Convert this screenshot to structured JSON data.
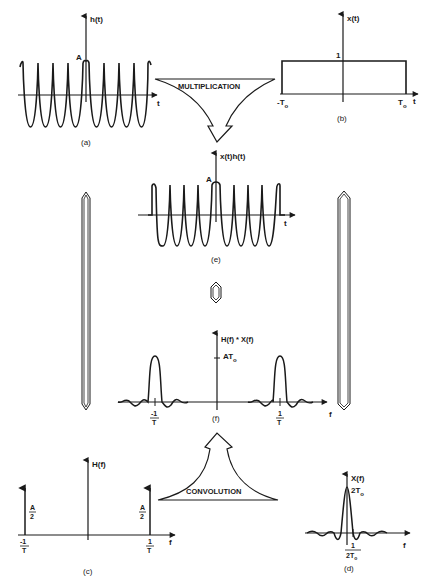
{
  "panels": {
    "a": {
      "caption": "(a)",
      "y_label": "h(t)",
      "x_label": "t",
      "amplitude_label": "A",
      "description": "cosine waveform of amplitude A, infinite duration"
    },
    "b": {
      "caption": "(b)",
      "y_label": "x(t)",
      "x_label": "t",
      "height_label": "1",
      "left_edge_label": "-T",
      "left_edge_sub": "o",
      "right_edge_label": "T",
      "right_edge_sub": "o",
      "description": "rectangular window of height 1 from -To to To"
    },
    "c": {
      "caption": "(c)",
      "y_label": "H(f)",
      "x_label": "f",
      "impulse_left_num": "A",
      "impulse_left_den": "2",
      "impulse_right_num": "A",
      "impulse_right_den": "2",
      "left_freq_num": "-1",
      "left_freq_den": "T",
      "right_freq_num": "1",
      "right_freq_den": "T"
    },
    "d": {
      "caption": "(d)",
      "y_label": "X(f)",
      "x_label": "f",
      "peak_label": "2T",
      "peak_sub": "o",
      "zero_num": "1",
      "zero_den": "2T",
      "zero_den_sub": "o"
    },
    "e": {
      "caption": "(e)",
      "y_label": "x(t)h(t)",
      "x_label": "t",
      "amplitude_label": "A"
    },
    "f": {
      "caption": "(f)",
      "y_label": "H(f) * X(f)",
      "x_label": "f",
      "peak_label": "AT",
      "peak_sub": "o",
      "left_freq_num": "-1",
      "left_freq_den": "T",
      "right_freq_num": "1",
      "right_freq_den": "T"
    }
  },
  "operations": {
    "multiplication": "MULTIPLICATION",
    "convolution": "CONVOLUTION"
  },
  "symbols": {
    "fourier_pair": "double-arrow-icon (Fourier transform pair)"
  }
}
